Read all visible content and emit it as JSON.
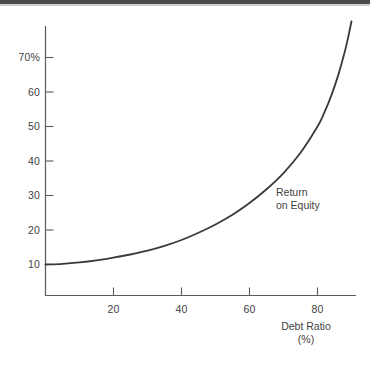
{
  "figure": {
    "background_color": "#ffffff",
    "ink_color": "#3b3b3b",
    "top_rule_color": "#4a4a4c"
  },
  "axes": {
    "y": {
      "labels": [
        "70%",
        "60",
        "50",
        "40",
        "30",
        "20",
        "10"
      ],
      "values": [
        70,
        60,
        50,
        40,
        30,
        20,
        10
      ]
    },
    "x": {
      "labels": [
        "20",
        "40",
        "60",
        "80"
      ],
      "values": [
        20,
        40,
        60,
        80
      ],
      "title": "Debt Ratio",
      "unit": "(%)"
    }
  },
  "annotations": {
    "series_label_line1": "Return",
    "series_label_line2": "on Equity"
  },
  "chart_data": {
    "type": "line",
    "title": "",
    "xlabel": "Debt Ratio (%)",
    "ylabel": "Return on Equity (%)",
    "xlim": [
      0,
      92
    ],
    "ylim": [
      0,
      82
    ],
    "grid": false,
    "legend": "none",
    "xticks": [
      20,
      40,
      60,
      80
    ],
    "yticks": [
      10,
      20,
      30,
      40,
      50,
      60,
      70
    ],
    "ytick_labels": [
      "10",
      "20",
      "30",
      "40",
      "50",
      "60",
      "70%"
    ],
    "series": [
      {
        "name": "Return on Equity",
        "color": "#3a3a3a",
        "line_width": 1.8,
        "x": [
          0,
          5,
          10,
          15,
          20,
          25,
          30,
          35,
          40,
          45,
          50,
          55,
          60,
          65,
          70,
          75,
          80,
          82,
          84,
          86,
          88,
          89,
          90
        ],
        "values": [
          10.0,
          10.2,
          10.6,
          11.2,
          12.0,
          12.9,
          14.0,
          15.4,
          17.1,
          19.2,
          21.6,
          24.4,
          27.8,
          31.8,
          36.5,
          42.4,
          50.0,
          54.0,
          58.8,
          64.6,
          71.6,
          75.8,
          80.5
        ]
      }
    ],
    "annotations": [
      {
        "text": "Return on Equity",
        "x": 63,
        "y": 30,
        "lines": [
          "Return",
          "on Equity"
        ]
      }
    ]
  }
}
